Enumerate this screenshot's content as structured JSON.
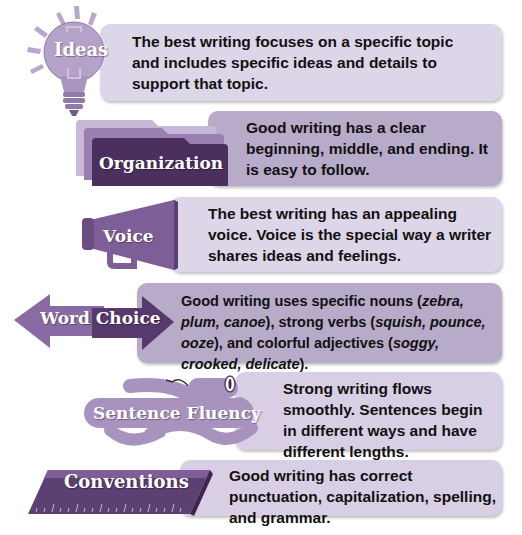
{
  "colors": {
    "box_light": "#ddd6e8",
    "box_mid": "#b7abc9",
    "purple_dark": "#4b2f5e",
    "purple_mid": "#7d5e96",
    "purple_light": "#a893bf"
  },
  "traits": [
    {
      "label": "Ideas",
      "icon": "lightbulb-icon",
      "text": "The best writing focuses on a specific topic and includes specific ideas and details to support that topic."
    },
    {
      "label": "Organization",
      "icon": "folder-icon",
      "text": "Good writing has a clear beginning, middle, and ending. It is easy to follow."
    },
    {
      "label": "Voice",
      "icon": "megaphone-icon",
      "text": "The best writing has an appealing voice. Voice is the special way a writer shares ideas and feelings."
    },
    {
      "label": "Word Choice",
      "icon": "double-arrow-icon",
      "text_parts": {
        "p1": "Good writing uses specific nouns (",
        "e1": "zebra, plum, canoe",
        "p2": "), strong verbs (",
        "e2": "squish, pounce, ooze",
        "p3": "), and colorful adjectives (",
        "e3": "soggy, crooked, delicate",
        "p4": ")."
      }
    },
    {
      "label": "Sentence Fluency",
      "icon": "snake-icon",
      "text": "Strong writing flows smoothly. Sentences begin in different ways and have different lengths."
    },
    {
      "label": "Conventions",
      "icon": "ruler-icon",
      "text": "Good writing has correct punctuation, capitalization, spelling, and grammar."
    }
  ]
}
